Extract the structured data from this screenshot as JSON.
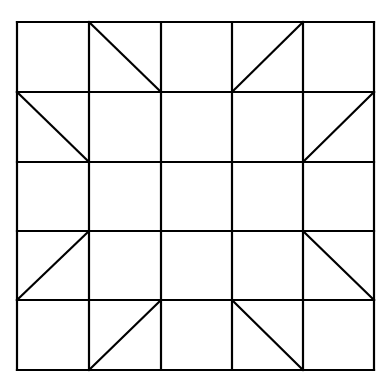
{
  "diagram": {
    "type": "quilt-block-grid",
    "rows": 5,
    "cols": 5,
    "stroke_color": "#000000",
    "background": "#ffffff",
    "stroke_width": 2.2,
    "x_lines": [
      17,
      89,
      161,
      232,
      303,
      374
    ],
    "y_lines": [
      22,
      92,
      162,
      231,
      300,
      370
    ],
    "diagonals": [
      {
        "row": 0,
        "col": 1,
        "dir": "tl-br"
      },
      {
        "row": 0,
        "col": 3,
        "dir": "bl-tr"
      },
      {
        "row": 1,
        "col": 0,
        "dir": "tl-br"
      },
      {
        "row": 1,
        "col": 4,
        "dir": "bl-tr"
      },
      {
        "row": 3,
        "col": 0,
        "dir": "bl-tr"
      },
      {
        "row": 3,
        "col": 4,
        "dir": "tl-br"
      },
      {
        "row": 4,
        "col": 1,
        "dir": "bl-tr"
      },
      {
        "row": 4,
        "col": 3,
        "dir": "tl-br"
      }
    ]
  }
}
